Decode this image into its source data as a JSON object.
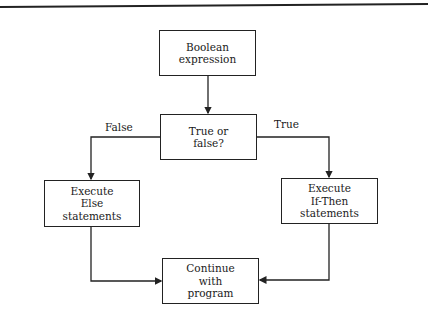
{
  "diagram": {
    "type": "flowchart",
    "nodes": [
      {
        "id": "boolean",
        "label": "Boolean\nexpression"
      },
      {
        "id": "decision",
        "label": "True or\nfalse?"
      },
      {
        "id": "else",
        "label": "Execute\nElse\nstatements"
      },
      {
        "id": "then",
        "label": "Execute\nIf-Then\nstatements"
      },
      {
        "id": "continue",
        "label": "Continue\nwith\nprogram"
      }
    ],
    "edges": [
      {
        "from": "boolean",
        "to": "decision",
        "label": ""
      },
      {
        "from": "decision",
        "to": "else",
        "label": "False"
      },
      {
        "from": "decision",
        "to": "then",
        "label": "True"
      },
      {
        "from": "else",
        "to": "continue",
        "label": ""
      },
      {
        "from": "then",
        "to": "continue",
        "label": ""
      }
    ],
    "edge_labels": {
      "false": "False",
      "true": "True"
    },
    "colors": {
      "line": "#222222",
      "background": "#ffffff",
      "text": "#1a1a1a"
    }
  }
}
